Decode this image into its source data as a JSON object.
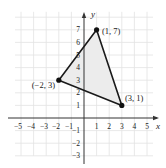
{
  "figure": {
    "type": "coordinate-plane-triangle",
    "x_axis_label": "x",
    "y_axis_label": "y",
    "x_ticks": [
      "−5",
      "−4",
      "−3",
      "−2",
      "−1",
      "1",
      "2",
      "3",
      "4",
      "5"
    ],
    "y_ticks_pos": [
      "1",
      "2",
      "3",
      "4",
      "5",
      "6",
      "7"
    ],
    "y_ticks_neg": [
      "−1",
      "−2",
      "−3"
    ],
    "vertices": [
      {
        "label": "(1, 7)",
        "x": 1,
        "y": 7
      },
      {
        "label": "(3, 1)",
        "x": 3,
        "y": 1
      },
      {
        "label": "(−2, 3)",
        "x": -2,
        "y": 3
      }
    ],
    "colors": {
      "grid": "#e2e2e2",
      "axis": "#333333",
      "triangle_stroke": "#1a1a1a",
      "fill": "#ececec",
      "point": "#111111"
    }
  }
}
